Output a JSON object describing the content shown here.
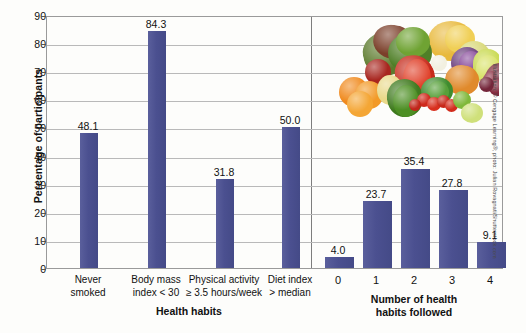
{
  "chart_data": {
    "type": "bar",
    "title": "",
    "ylabel": "Percentage of participants",
    "ylim": [
      0,
      90
    ],
    "ytick_step": 10,
    "yticks": [
      "0",
      "10",
      "20",
      "30",
      "40",
      "50",
      "60",
      "70",
      "80",
      "90"
    ],
    "grid": true,
    "legend": "none",
    "bar_color": "#4e5391",
    "panels": [
      {
        "name": "health-habits",
        "xlabel": "Health habits",
        "categories": [
          [
            "Never",
            "smoked"
          ],
          [
            "Body mass",
            "index < 30"
          ],
          [
            "Physical activity",
            "≥ 3.5 hours/week"
          ],
          [
            "Diet index",
            "> median"
          ]
        ],
        "values": [
          48.1,
          84.3,
          31.8,
          50.0
        ],
        "value_labels": [
          "48.1",
          "84.3",
          "31.8",
          "50.0"
        ]
      },
      {
        "name": "habits-followed",
        "xlabel": [
          "Number of health",
          "habits followed"
        ],
        "categories": [
          "0",
          "1",
          "2",
          "3",
          "4"
        ],
        "values": [
          4.0,
          23.7,
          35.4,
          27.8,
          9.1
        ],
        "value_labels": [
          "4.0",
          "23.7",
          "35.4",
          "27.8",
          "9.1"
        ]
      }
    ]
  },
  "photo": {
    "alt": "assorted fruits and vegetables"
  },
  "credit": {
    "text": "Illustration: © Cengage Learning®; photo: Julian Rovagnati/Shutterstock.com"
  }
}
